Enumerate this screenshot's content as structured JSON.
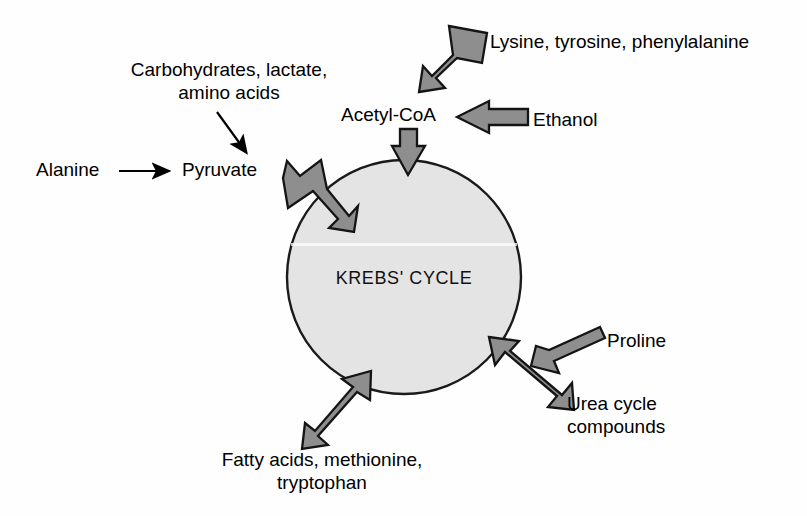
{
  "diagram": {
    "center_node": {
      "label": "KREBS' CYCLE",
      "shape": "circle",
      "fill_color": "#e4e4e4",
      "stroke_color": "#1a1a1a",
      "cx": 404,
      "cy": 277,
      "r": 117
    },
    "colors": {
      "background": "#fefefe",
      "arrow_fill": "#8e8e8e",
      "arrow_stroke": "#141414",
      "text": "#000000",
      "thin_arrow": "#000000"
    },
    "labels": [
      {
        "id": "alanine",
        "text": "Alanine",
        "x": 36,
        "y": 158,
        "align": "left"
      },
      {
        "id": "carbohydrates",
        "text": "Carbohydrates, lactate,\namino acids",
        "x": 110,
        "y": 58,
        "align": "center"
      },
      {
        "id": "pyruvate",
        "text": "Pyruvate",
        "x": 182,
        "y": 158,
        "align": "left"
      },
      {
        "id": "acetyl-coa",
        "text": "Acetyl-CoA",
        "x": 341,
        "y": 103,
        "align": "left"
      },
      {
        "id": "lysine-tyrosine-phenylalanine",
        "text": "Lysine, tyrosine, phenylalanine",
        "x": 490,
        "y": 30,
        "align": "left"
      },
      {
        "id": "ethanol",
        "text": "Ethanol",
        "x": 533,
        "y": 108,
        "align": "left"
      },
      {
        "id": "proline",
        "text": "Proline",
        "x": 607,
        "y": 329,
        "align": "left"
      },
      {
        "id": "urea-cycle-compounds",
        "text": "Urea cycle\ncompounds",
        "x": 567,
        "y": 392,
        "align": "left"
      },
      {
        "id": "fatty-acids-methionine-tryptophan",
        "text": "Fatty acids, methionine,\ntryptophan",
        "x": 197,
        "y": 448,
        "align": "center"
      }
    ],
    "arrows": [
      {
        "id": "alanine-to-pyruvate",
        "style": "thin-line",
        "from": "Alanine",
        "to": "Pyruvate"
      },
      {
        "id": "carbohydrates-to-pyruvate",
        "style": "thin-line",
        "from": "Carbohydrates, lactate, amino acids",
        "to": "Pyruvate"
      },
      {
        "id": "pyruvate-to-cycle",
        "style": "block-elbow",
        "from": "Pyruvate",
        "to": "KREBS' CYCLE"
      },
      {
        "id": "lysine-to-acetyl-coa",
        "style": "block-diagonal",
        "from": "Lysine, tyrosine, phenylalanine",
        "to": "Acetyl-CoA"
      },
      {
        "id": "ethanol-to-acetyl-coa",
        "style": "block-horizontal",
        "from": "Ethanol",
        "to": "Acetyl-CoA"
      },
      {
        "id": "acetyl-coa-to-cycle",
        "style": "block-vertical",
        "from": "Acetyl-CoA",
        "to": "KREBS' CYCLE"
      },
      {
        "id": "proline-to-cycle",
        "style": "block-thin-diagonal",
        "from": "Proline",
        "to": "KREBS' CYCLE"
      },
      {
        "id": "urea-to-cycle",
        "style": "block-diagonal",
        "from": "Urea cycle compounds",
        "to": "KREBS' CYCLE"
      },
      {
        "id": "fatty-acids-to-cycle",
        "style": "block-diagonal",
        "from": "Fatty acids, methionine, tryptophan",
        "to": "KREBS' CYCLE"
      }
    ]
  }
}
